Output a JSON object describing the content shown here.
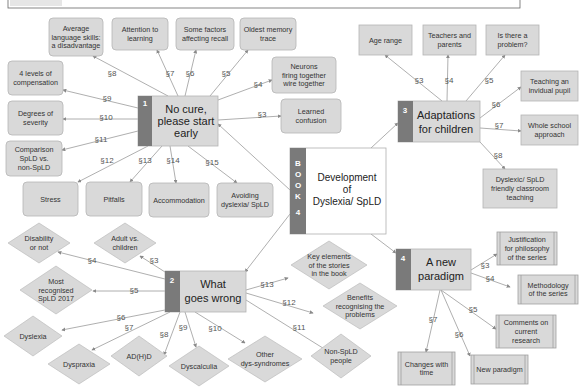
{
  "top_strip": {
    "visible": true
  },
  "center": {
    "book_letters": [
      "B",
      "O",
      "O",
      "K"
    ],
    "book_number": "4",
    "title_lines": [
      "Development",
      "of",
      "Dyslexia/ SpLD"
    ]
  },
  "topics": [
    {
      "id": "t1",
      "number": "1",
      "lines": [
        "No cure,",
        "please start",
        "early"
      ]
    },
    {
      "id": "t2",
      "number": "2",
      "lines": [
        "What",
        "goes wrong"
      ]
    },
    {
      "id": "t3",
      "number": "3",
      "lines": [
        "Adaptations",
        "for children"
      ]
    },
    {
      "id": "t4",
      "number": "4",
      "lines": [
        "A new",
        "paradigm"
      ]
    }
  ],
  "t1_children": [
    {
      "section": "§3",
      "lines": [
        "Learned",
        "confusion"
      ]
    },
    {
      "section": "§4",
      "lines": [
        "Neurons",
        "firing together",
        "wire together"
      ]
    },
    {
      "section": "§5",
      "lines": [
        "Oldest memory",
        "trace"
      ]
    },
    {
      "section": "§6",
      "lines": [
        "Some factors",
        "affecting recall"
      ]
    },
    {
      "section": "§7",
      "lines": [
        "Attention to",
        "learning"
      ]
    },
    {
      "section": "§8",
      "lines": [
        "Average",
        "language skills:",
        "a disadvantage"
      ]
    },
    {
      "section": "§9",
      "lines": [
        "4 levels of",
        "compensation"
      ]
    },
    {
      "section": "§10",
      "lines": [
        "Degrees of",
        "severity"
      ]
    },
    {
      "section": "§11",
      "lines": [
        "Comparison",
        "SpLD vs.",
        "non-SpLD"
      ]
    },
    {
      "section": "§12",
      "lines": [
        "Stress"
      ]
    },
    {
      "section": "§13",
      "lines": [
        "Pitfalls"
      ]
    },
    {
      "section": "§14",
      "lines": [
        "Accommodation"
      ]
    },
    {
      "section": "§15",
      "lines": [
        "Avoiding",
        "dyslexia/ SpLD"
      ]
    }
  ],
  "t2_children": [
    {
      "section": "§3",
      "lines": [
        "Adult vs.",
        "children"
      ]
    },
    {
      "section": "§4",
      "lines": [
        "Disability",
        "or not"
      ]
    },
    {
      "section": "§5",
      "lines": [
        "Most",
        "recognised",
        "SpLD 2017"
      ]
    },
    {
      "section": "§6",
      "lines": [
        "Dyslexia"
      ]
    },
    {
      "section": "§7",
      "lines": [
        "Dyspraxia"
      ]
    },
    {
      "section": "§8",
      "lines": [
        "AD(H)D"
      ]
    },
    {
      "section": "§9",
      "lines": [
        "Dyscalculia"
      ]
    },
    {
      "section": "§10",
      "lines": [
        "Other",
        "dys-syndromes"
      ]
    },
    {
      "section": "§11",
      "lines": [
        "Non-SpLD",
        "people"
      ]
    },
    {
      "section": "§12",
      "lines": [
        "Benefits",
        "recognising the",
        "problems"
      ]
    },
    {
      "section": "§13",
      "lines": [
        "Key elements",
        "of the stories",
        "in the book"
      ]
    }
  ],
  "t3_children": [
    {
      "section": "§3",
      "lines": [
        "Age range"
      ]
    },
    {
      "section": "§4",
      "lines": [
        "Teachers and",
        "parents"
      ]
    },
    {
      "section": "§5",
      "lines": [
        "Is there a",
        "problem?"
      ]
    },
    {
      "section": "§6",
      "lines": [
        "Teaching an",
        "invidual pupil"
      ]
    },
    {
      "section": "§7",
      "lines": [
        "Whole school",
        "approach"
      ]
    },
    {
      "section": "§8",
      "lines": [
        "Dyslexic/ SpLD",
        "friendly classroom",
        "teaching"
      ]
    }
  ],
  "t4_children": [
    {
      "section": "§3",
      "lines": [
        "Justification",
        "for philosophy",
        "of the series"
      ]
    },
    {
      "section": "§4",
      "lines": [
        "Methodology",
        "of the series"
      ]
    },
    {
      "section": "§5",
      "lines": [
        "Comments on",
        "current",
        "research"
      ]
    },
    {
      "section": "§6",
      "lines": [
        "New paradigm"
      ]
    },
    {
      "section": "§7",
      "lines": [
        "Changes with",
        "time"
      ]
    }
  ],
  "colors": {
    "node_fill": "#d9d9d9",
    "node_stroke": "#b5b5b5",
    "number_strip": "#7a7a7a",
    "line": "#9a9a9a",
    "text": "#333333"
  }
}
